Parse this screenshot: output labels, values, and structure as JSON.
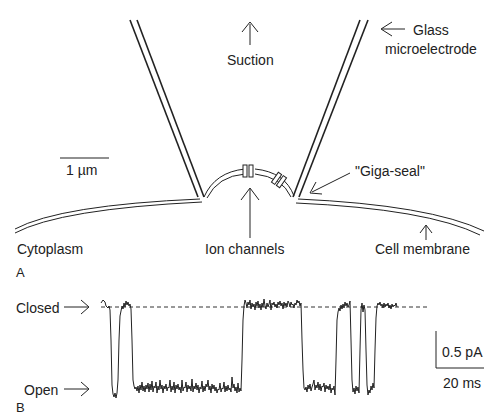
{
  "panel_a": {
    "letter": "A",
    "labels": {
      "suction": "Suction",
      "glass_line1": "Glass",
      "glass_line2": "microelectrode",
      "scale_bar": "1 µm",
      "giga_seal": "\"Giga-seal\"",
      "cytoplasm": "Cytoplasm",
      "ion_channels": "Ion channels",
      "cell_membrane": "Cell membrane"
    }
  },
  "panel_b": {
    "letter": "B",
    "labels": {
      "closed": "Closed",
      "open": "Open",
      "scale_current": "0.5 pA",
      "scale_time": "20 ms"
    }
  },
  "colors": {
    "ink": "#222222",
    "background": "#ffffff"
  }
}
